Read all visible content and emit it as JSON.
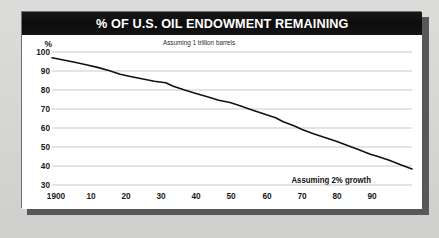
{
  "card": {
    "title": "% OF U.S. OIL ENDOWMENT REMAINING",
    "title_bar_color": "#111111",
    "title_text_color": "#ffffff",
    "background_color": "#ffffff",
    "page_background_color": "#d9d9d7",
    "shadow_color": "#58585a"
  },
  "chart_data": {
    "type": "line",
    "title": "% OF U.S. OIL ENDOWMENT REMAINING",
    "subtitle": "",
    "xlabel": "",
    "ylabel": "%",
    "y_unit_label": "%",
    "grid": true,
    "grid_color": "#c9c9c9",
    "legend_position": "none",
    "line_color": "#111111",
    "line_width": 1.6,
    "xlim": [
      1900,
      1995
    ],
    "ylim": [
      30,
      100
    ],
    "yticks": [
      100,
      90,
      80,
      70,
      60,
      50,
      40,
      30
    ],
    "ytick_labels": [
      "100",
      "90",
      "80",
      "70",
      "60",
      "50",
      "40",
      "30"
    ],
    "xticks": [
      1900,
      1910,
      1920,
      1930,
      1940,
      1950,
      1960,
      1970,
      1980,
      1990
    ],
    "xtick_labels": [
      "1900",
      "10",
      "20",
      "30",
      "40",
      "50",
      "60",
      "70",
      "80",
      "90"
    ],
    "annotations": [
      {
        "text": "Assuming 1 trillion barrels",
        "position": "top-center",
        "bold": false
      },
      {
        "text": "Assuming 2% growth",
        "position": "bottom-right",
        "bold": true
      }
    ],
    "series": [
      {
        "name": "% of U.S. oil endowment remaining",
        "x": [
          1900,
          1903,
          1906,
          1909,
          1912,
          1915,
          1916,
          1918,
          1921,
          1924,
          1927,
          1930,
          1932,
          1935,
          1938,
          1941,
          1944,
          1947,
          1950,
          1953,
          1956,
          1959,
          1961,
          1964,
          1966,
          1969,
          1972,
          1975,
          1978,
          1981,
          1984,
          1986,
          1989,
          1992,
          1995
        ],
        "values": [
          97.0,
          95.8,
          94.6,
          93.3,
          91.9,
          90.3,
          89.6,
          88.3,
          87.0,
          85.8,
          84.6,
          83.8,
          82.0,
          80.0,
          78.2,
          76.4,
          74.6,
          73.4,
          71.4,
          69.4,
          67.4,
          65.4,
          63.3,
          61.0,
          59.2,
          57.0,
          55.0,
          53.0,
          50.8,
          48.6,
          46.2,
          45.0,
          43.0,
          40.6,
          38.4
        ]
      }
    ]
  }
}
